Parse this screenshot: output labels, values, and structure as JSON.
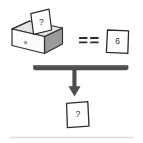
{
  "diagram": {
    "background_color": "#ffffff",
    "ink_color": "#2b2b2b",
    "bar_color": "#4d4d4d",
    "box_top_fill": "#e8e8e8",
    "box_front_fill": "#fbfbfb",
    "box_side_fill": "#9a9a9a",
    "paper_fill": "#ffffff",
    "footer_rule_color": "#d8d8d8",
    "box": {
      "label": "a",
      "contained_paper": {
        "value": "?"
      }
    },
    "operator": {
      "symbol": "==",
      "name": "equality-operator"
    },
    "comparison_paper": {
      "value": "6"
    },
    "result_paper": {
      "value": "?"
    },
    "flow": {
      "bar_name": "horizontal-rule-bar",
      "arrow_name": "down-arrow",
      "direction": "down"
    }
  }
}
